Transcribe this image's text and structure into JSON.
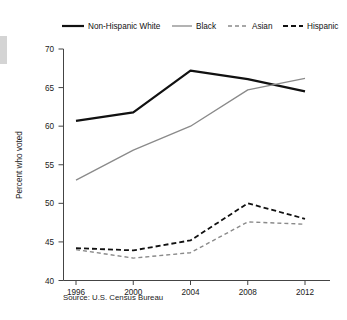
{
  "chart_data": {
    "type": "line",
    "title": "",
    "xlabel": "",
    "ylabel": "Percent who voted",
    "categories": [
      "1996",
      "2000",
      "2004",
      "2008",
      "2012"
    ],
    "x": [
      1996,
      2000,
      2004,
      2008,
      2012
    ],
    "ylim": [
      40,
      70
    ],
    "yticks": [
      40,
      45,
      50,
      55,
      60,
      65,
      70
    ],
    "ytick_labels": [
      "40",
      "45",
      "50",
      "55",
      "60",
      "65",
      "70"
    ],
    "grid": false,
    "legend_position": "top",
    "series": [
      {
        "name": "Non-Hispanic White",
        "values": [
          60.7,
          61.8,
          67.2,
          66.1,
          64.5
        ],
        "color": "#111111",
        "style": "solid",
        "width": 2.2
      },
      {
        "name": "Black",
        "values": [
          53.0,
          56.9,
          60.0,
          64.7,
          66.2
        ],
        "color": "#8a8a8a",
        "style": "solid",
        "width": 1.3
      },
      {
        "name": "Asian",
        "values": [
          44.0,
          42.9,
          43.6,
          47.6,
          47.3
        ],
        "color": "#8a8a8a",
        "style": "dashed",
        "width": 1.4
      },
      {
        "name": "Hispanic",
        "values": [
          44.2,
          43.9,
          45.2,
          50.0,
          48.0
        ],
        "color": "#111111",
        "style": "dashed",
        "width": 1.8
      }
    ],
    "source": "Source: U.S. Census Bureau"
  },
  "legend": {
    "items": [
      {
        "label": "Non-Hispanic White"
      },
      {
        "label": "Black"
      },
      {
        "label": "Asian"
      },
      {
        "label": "Hispanic"
      }
    ]
  },
  "axes": {
    "y_title": "Percent who voted"
  },
  "footer": {
    "source": "Source: U.S. Census Bureau"
  }
}
